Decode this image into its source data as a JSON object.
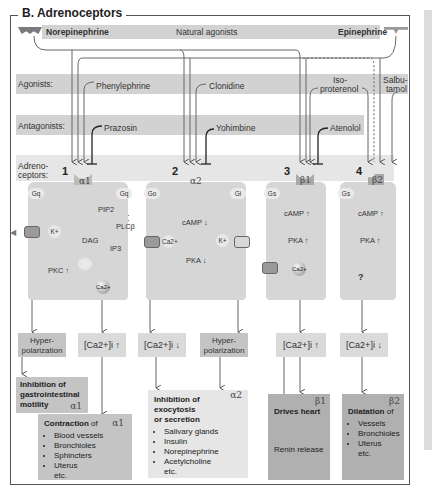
{
  "title": "B. Adrenoceptors",
  "natural_agonists": {
    "left": "Norepinephrine",
    "center": "Natural agonists",
    "right": "Epinephrine"
  },
  "rows": {
    "agonists_label": "Agonists:",
    "antagonists_label": "Antagonists:",
    "adrenoceptors_label_1": "Adreno-",
    "adrenoceptors_label_2": "ceptors:"
  },
  "agonists": [
    {
      "name": "Phenylephrine",
      "target": "α1"
    },
    {
      "name": "Clonidine",
      "target": "α2"
    },
    {
      "name_line1": "Iso-",
      "name_line2": "proterenol",
      "target": "β1"
    },
    {
      "name_line1": "Salbu-",
      "name_line2": "tamol",
      "target": "β2"
    }
  ],
  "antagonists": [
    {
      "name": "Prazosin",
      "target": "α1"
    },
    {
      "name": "Yohimbine",
      "target": "α2"
    },
    {
      "name": "Atenolol",
      "target": "β1"
    }
  ],
  "receptors": [
    {
      "number": "1",
      "name": "α1",
      "g_proteins": [
        "Gq",
        "Gq"
      ],
      "molecules": [
        "PIP2",
        "PLCβ",
        "DAG",
        "IP3",
        "PKC ↑",
        "K+",
        "Ca2+"
      ],
      "outcomes": [
        "Hyper-polarization",
        "[Ca2+]i ↑"
      ]
    },
    {
      "number": "2",
      "name": "α2",
      "g_proteins": [
        "Go",
        "Gi"
      ],
      "molecules": [
        "cAMP ↓",
        "PKA ↓",
        "Ca2+",
        "K+"
      ],
      "outcomes": [
        "[Ca2+]i ↓",
        "Hyper-polarization"
      ]
    },
    {
      "number": "3",
      "name": "β1",
      "g_proteins": [
        "Gs"
      ],
      "molecules": [
        "cAMP ↑",
        "PKA ↑",
        "Ca2+"
      ],
      "outcomes": [
        "[Ca2+]i ↑"
      ]
    },
    {
      "number": "4",
      "name": "β2",
      "g_proteins": [
        "Gs"
      ],
      "molecules": [
        "cAMP ↑",
        "PKA ↑",
        "?"
      ],
      "outcomes": [
        "[Ca2+]i ↓"
      ]
    }
  ],
  "effects": {
    "gi_inhibition": {
      "title_line1": "Inhibition of",
      "title_line2": "gastrointestinal",
      "title_line3": "motility",
      "tag": "α1"
    },
    "contraction": {
      "title": "Contraction",
      "suffix": " of",
      "tag": "α1",
      "items": [
        "Blood vessels",
        "Bronchioles",
        "Sphincters",
        "Uterus"
      ],
      "etc": "etc."
    },
    "inhibition_exocytosis": {
      "title_line1": "Inhibition of",
      "title_line2": "exocytosis",
      "title_line3": "or secretion",
      "tag": "α2",
      "items": [
        "Salivary glands",
        "Insulin",
        "Norepinephrine",
        "Acetylcholine"
      ],
      "etc": "etc."
    },
    "drives_heart": {
      "title": "Drives heart",
      "tag": "β1",
      "sub": "Renin release"
    },
    "dilatation": {
      "title": "Dilatation",
      "suffix": " of",
      "tag": "β2",
      "items": [
        "Vessels",
        "Bronchioles",
        "Uterus"
      ],
      "etc": "etc."
    }
  },
  "colors": {
    "band_dark": "#d2d2d2",
    "band_light": "#e6e6e6",
    "cell": "#d6d6d6",
    "effect_dark": "#b0b0b0",
    "effect_mid": "#c4c4c4",
    "effect_pale": "#e6e6e6",
    "line": "#555555"
  }
}
